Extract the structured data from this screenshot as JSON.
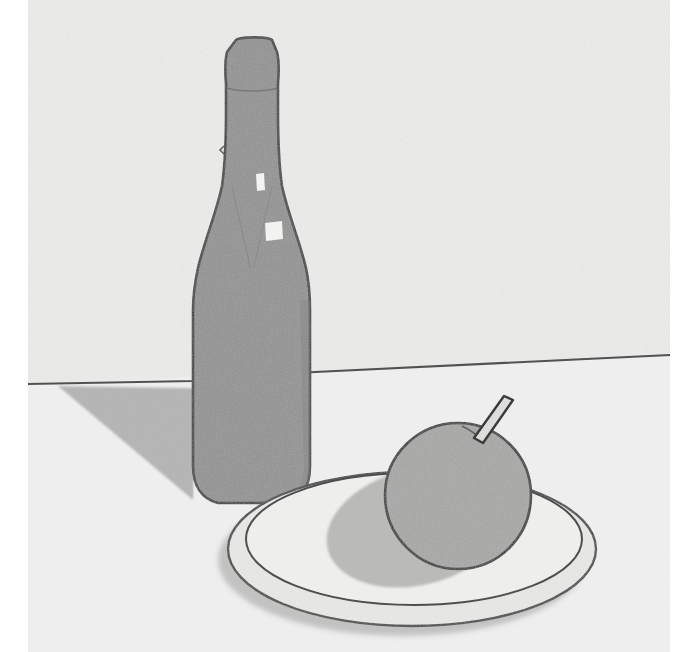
{
  "page": {
    "background_color": "#ffffff",
    "width": 697,
    "height": 652
  },
  "clipped_text_above": {
    "fragment": "p",
    "note_visible": "descender of a bold letter cropped by the top image border"
  },
  "artwork": {
    "title": "Still life with bottle, apple and plate",
    "medium_look": "scanned pencil and grey marker drawing on textured paper",
    "paper_color": "#ececeb",
    "paper_edge_left": 28,
    "paper_edge_right": 670,
    "outline_color": "#3b3b3b",
    "tone_dark": "#8a8a8a",
    "tone_mid": "#9d9d9d",
    "tone_light": "#b6b6b6",
    "tone_plate": "#e4e4e2",
    "highlight_color": "#f4f4f2",
    "objects": [
      {
        "name": "bottle",
        "label": "wine bottle",
        "fill": "#8d8d8d",
        "cap_top_y": 37,
        "body_left_x": 193,
        "body_right_x": 310,
        "base_y": 505,
        "highlights": 2
      },
      {
        "name": "bottle-shadow",
        "label": "cast shadow of bottle",
        "fill": "#b0b0af"
      },
      {
        "name": "apple",
        "label": "apple",
        "fill": "#a3a3a2",
        "center_x": 458,
        "center_y": 496,
        "radius": 73
      },
      {
        "name": "apple-stem",
        "label": "apple stem",
        "fill": "#d8d8d6"
      },
      {
        "name": "apple-shadow",
        "label": "cast shadow of apple on plate",
        "fill": "#b2b2b1"
      },
      {
        "name": "plate",
        "label": "round plate",
        "fill": "#e8e8e6",
        "left_x": 228,
        "right_x": 596,
        "top_y": 472,
        "bottom_y": 626
      },
      {
        "name": "horizon-line",
        "label": "table edge / horizon line",
        "left_y": 383,
        "right_y": 355
      }
    ]
  }
}
